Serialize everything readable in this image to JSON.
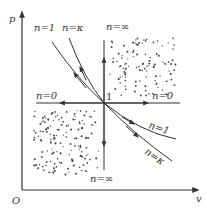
{
  "diagram": {
    "axes": {
      "y_label": "p",
      "x_label": "v",
      "origin_label": "O"
    },
    "center_point_label": "1",
    "processes": [
      {
        "id": "n1",
        "label": "n=1",
        "kind": "isothermal curve"
      },
      {
        "id": "nk",
        "label": "n=κ",
        "kind": "adiabatic curve"
      },
      {
        "id": "n0_left",
        "label": "n=0",
        "kind": "isobaric line (left)"
      },
      {
        "id": "n0_right",
        "label": "n=0",
        "kind": "isobaric line (right)"
      },
      {
        "id": "ninf_top",
        "label": "n=∞",
        "kind": "isochoric line (top)"
      },
      {
        "id": "ninf_bottom",
        "label": "n=∞",
        "kind": "isochoric line (bottom)"
      },
      {
        "id": "n1_low",
        "label": "n=1",
        "kind": "isothermal curve lower branch"
      },
      {
        "id": "nk_low",
        "label": "n=κ",
        "kind": "adiabatic curve lower branch"
      }
    ],
    "regions": [
      {
        "name": "upper-right shaded region",
        "pattern": "dots"
      },
      {
        "name": "lower-left shaded region",
        "pattern": "dots"
      }
    ],
    "colors": {
      "line": "#333333",
      "dots": "#444444",
      "background": "#ffffff"
    }
  }
}
